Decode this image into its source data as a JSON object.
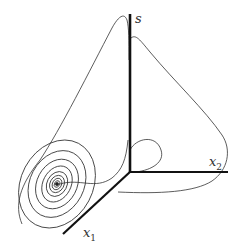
{
  "figure": {
    "type": "3d-phase-portrait",
    "axes": {
      "s": {
        "label": "s"
      },
      "x1": {
        "label": "x",
        "sub": "1"
      },
      "x2": {
        "label": "x",
        "sub": "2"
      }
    },
    "colors": {
      "axis": "#111111",
      "trajectory": "#333333",
      "background": "#ffffff"
    },
    "features": [
      "spiral-focus",
      "outer-trajectory-loop",
      "small-loop-near-origin"
    ]
  }
}
